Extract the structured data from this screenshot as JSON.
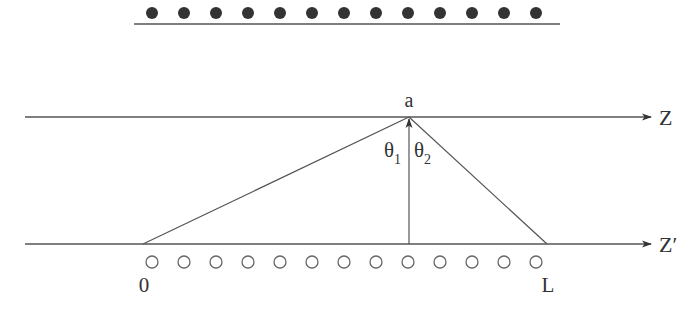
{
  "diagram": {
    "top_row": {
      "count": 13,
      "marker": "filled-circle"
    },
    "bottom_row": {
      "count": 13,
      "marker": "open-circle"
    },
    "axes": {
      "upper": {
        "label": "Z"
      },
      "lower": {
        "label": "Z′"
      }
    },
    "point_label": "a",
    "angles": [
      {
        "symbol": "θ",
        "subscript": "1"
      },
      {
        "symbol": "θ",
        "subscript": "2"
      }
    ],
    "segment_labels": {
      "start": "0",
      "end": "L"
    },
    "colors": {
      "line": "#555555",
      "dot": "#333333",
      "text": "#333333"
    }
  }
}
